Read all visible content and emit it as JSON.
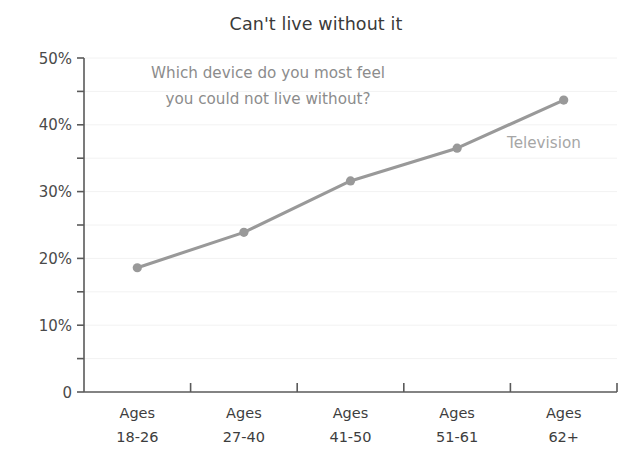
{
  "chart": {
    "title": "Can't live without it",
    "annotation_line1": "Which device do you most feel",
    "annotation_line2": "you could not live without?",
    "series_label": "Television",
    "line_color": "#999999",
    "marker_color": "#999999",
    "axis_color": "#5a5a5a",
    "grid_color": "#f2f2f2",
    "title_color": "#3a3a3a",
    "annotation_color": "#8c8c8c",
    "series_label_color": "#a6a6a6"
  },
  "chart_data": {
    "type": "line",
    "title": "Can't live without it",
    "subtitle": "Which device do you most feel you could not live without?",
    "xlabel": "",
    "ylabel": "",
    "ylim": [
      0,
      50
    ],
    "grid": true,
    "legend_position": "inline-right",
    "categories": [
      "Ages 18-26",
      "Ages 27-40",
      "Ages 41-50",
      "Ages 51-61",
      "Ages 62+"
    ],
    "category_lines": [
      [
        "Ages",
        "18-26"
      ],
      [
        "Ages",
        "27-40"
      ],
      [
        "Ages",
        "41-50"
      ],
      [
        "Ages",
        "51-61"
      ],
      [
        "Ages",
        "62+"
      ]
    ],
    "series": [
      {
        "name": "Television",
        "values": [
          18.6,
          23.9,
          31.6,
          36.5,
          43.7
        ]
      }
    ],
    "ytick_labels": [
      "0",
      "10%",
      "20%",
      "30%",
      "40%",
      "50%"
    ],
    "ytick_values": [
      0,
      10,
      20,
      30,
      40,
      50
    ],
    "yminor_values": [
      5,
      15,
      25,
      35,
      45
    ]
  }
}
